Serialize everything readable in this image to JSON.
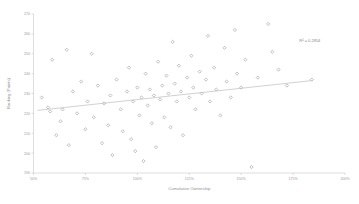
{
  "chart_data": {
    "type": "scatter",
    "title": "",
    "xlabel": "Cumulative Ownership",
    "ylabel": "Ranking (Points)",
    "xlim": [
      50,
      200
    ],
    "ylim": [
      190,
      270
    ],
    "xticks": [
      "50%",
      "75%",
      "100%",
      "125%",
      "150%",
      "175%",
      "200%"
    ],
    "xtick_values": [
      50,
      75,
      100,
      125,
      150,
      175,
      200
    ],
    "yticks": [
      "270",
      "260",
      "250",
      "240",
      "230",
      "220",
      "210",
      "200",
      "190"
    ],
    "ytick_values": [
      270,
      260,
      250,
      240,
      230,
      220,
      210,
      200,
      190
    ],
    "grid": false,
    "legend": "none",
    "annotations": [
      {
        "name": "r-squared",
        "text": "R² = 0.2854",
        "x": 178,
        "y": 256
      }
    ],
    "trendline": {
      "type": "linear",
      "x_start": 52,
      "y_start": 221.5,
      "x_end": 184,
      "y_end": 236.5,
      "r_squared": 0.2854
    },
    "marker": {
      "shape": "diamond",
      "color": "#8d8d9a",
      "size": 1.6
    },
    "points": [
      {
        "x": 54,
        "y": 228
      },
      {
        "x": 57,
        "y": 223
      },
      {
        "x": 58,
        "y": 221
      },
      {
        "x": 59,
        "y": 247
      },
      {
        "x": 61,
        "y": 209
      },
      {
        "x": 63,
        "y": 216
      },
      {
        "x": 64,
        "y": 222
      },
      {
        "x": 66,
        "y": 252
      },
      {
        "x": 67,
        "y": 204
      },
      {
        "x": 69,
        "y": 231
      },
      {
        "x": 71,
        "y": 220
      },
      {
        "x": 73,
        "y": 236
      },
      {
        "x": 75,
        "y": 212
      },
      {
        "x": 76,
        "y": 226
      },
      {
        "x": 78,
        "y": 250
      },
      {
        "x": 79,
        "y": 218
      },
      {
        "x": 81,
        "y": 234
      },
      {
        "x": 83,
        "y": 205
      },
      {
        "x": 84,
        "y": 225
      },
      {
        "x": 86,
        "y": 214
      },
      {
        "x": 87,
        "y": 229
      },
      {
        "x": 88,
        "y": 199
      },
      {
        "x": 90,
        "y": 237
      },
      {
        "x": 92,
        "y": 222
      },
      {
        "x": 93,
        "y": 211
      },
      {
        "x": 95,
        "y": 231
      },
      {
        "x": 96,
        "y": 243
      },
      {
        "x": 97,
        "y": 207
      },
      {
        "x": 98,
        "y": 226
      },
      {
        "x": 99,
        "y": 201
      },
      {
        "x": 100,
        "y": 233
      },
      {
        "x": 101,
        "y": 219
      },
      {
        "x": 102,
        "y": 228
      },
      {
        "x": 103,
        "y": 196
      },
      {
        "x": 104,
        "y": 240
      },
      {
        "x": 105,
        "y": 224
      },
      {
        "x": 106,
        "y": 232
      },
      {
        "x": 107,
        "y": 215
      },
      {
        "x": 108,
        "y": 229
      },
      {
        "x": 109,
        "y": 203
      },
      {
        "x": 110,
        "y": 246
      },
      {
        "x": 111,
        "y": 227
      },
      {
        "x": 112,
        "y": 234
      },
      {
        "x": 113,
        "y": 218
      },
      {
        "x": 114,
        "y": 239
      },
      {
        "x": 115,
        "y": 230
      },
      {
        "x": 116,
        "y": 213
      },
      {
        "x": 117,
        "y": 256
      },
      {
        "x": 118,
        "y": 235
      },
      {
        "x": 119,
        "y": 226
      },
      {
        "x": 120,
        "y": 244
      },
      {
        "x": 121,
        "y": 231
      },
      {
        "x": 122,
        "y": 209
      },
      {
        "x": 124,
        "y": 238
      },
      {
        "x": 125,
        "y": 228
      },
      {
        "x": 126,
        "y": 249
      },
      {
        "x": 127,
        "y": 233
      },
      {
        "x": 128,
        "y": 222
      },
      {
        "x": 130,
        "y": 241
      },
      {
        "x": 131,
        "y": 230
      },
      {
        "x": 133,
        "y": 237
      },
      {
        "x": 134,
        "y": 259
      },
      {
        "x": 135,
        "y": 226
      },
      {
        "x": 137,
        "y": 243
      },
      {
        "x": 138,
        "y": 232
      },
      {
        "x": 140,
        "y": 219
      },
      {
        "x": 142,
        "y": 253
      },
      {
        "x": 143,
        "y": 236
      },
      {
        "x": 145,
        "y": 228
      },
      {
        "x": 147,
        "y": 262
      },
      {
        "x": 148,
        "y": 240
      },
      {
        "x": 150,
        "y": 233
      },
      {
        "x": 152,
        "y": 247
      },
      {
        "x": 155,
        "y": 193
      },
      {
        "x": 158,
        "y": 238
      },
      {
        "x": 163,
        "y": 265
      },
      {
        "x": 165,
        "y": 251
      },
      {
        "x": 168,
        "y": 242
      },
      {
        "x": 172,
        "y": 234
      },
      {
        "x": 184,
        "y": 237
      }
    ]
  }
}
